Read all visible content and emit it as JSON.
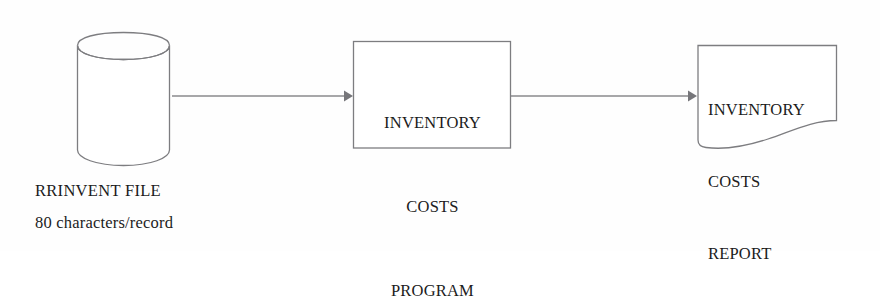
{
  "diagram": {
    "type": "system-flowchart",
    "background_color": "#fefefe",
    "line_color": "#8a8a8d",
    "shape_stroke_color": "#7d7d80",
    "text_color": "#1c1c1c",
    "nodes": [
      {
        "id": "rrinvent-file",
        "shape": "cylinder",
        "role": "input-data-file",
        "label": "RRINVENT FILE",
        "detail": "80 characters/record"
      },
      {
        "id": "inventory-costs-program",
        "shape": "rectangle",
        "role": "process",
        "lines": [
          "INVENTORY",
          "COSTS",
          "PROGRAM"
        ]
      },
      {
        "id": "inventory-costs-report",
        "shape": "document",
        "role": "output-report",
        "lines": [
          "INVENTORY",
          "COSTS",
          "REPORT"
        ]
      }
    ],
    "connectors": [
      {
        "id": "file-to-program",
        "from": "rrinvent-file",
        "to": "inventory-costs-program",
        "style": "solid-arrow",
        "direction": "right"
      },
      {
        "id": "program-to-report",
        "from": "inventory-costs-program",
        "to": "inventory-costs-report",
        "style": "solid-arrow",
        "direction": "right"
      }
    ]
  }
}
